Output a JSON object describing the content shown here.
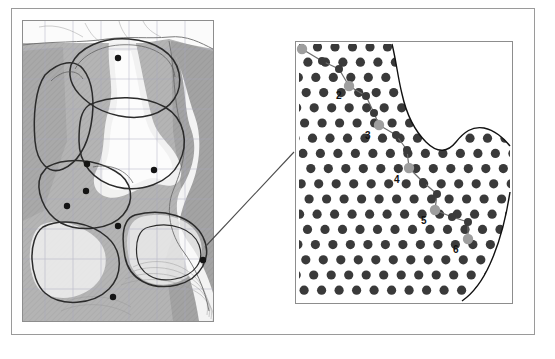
{
  "figure": {
    "title": "",
    "background_color": "#ffffff",
    "frame_color": "#9a9a9a",
    "width": 555,
    "height": 359
  },
  "left_panel": {
    "name": "regional-map",
    "description": "Grayscale shaded relief map with graticule grid, coastline contours and polygon region outlines",
    "border_color": "#8d8d8d",
    "land_fill": "#b4b4b4",
    "water_fill": "#f2f2f2",
    "mid_fill": "#c9c9c9",
    "dark_fill": "#9d9d9d",
    "grid_color": "#a9a9c0",
    "outline_color": "#2b2b2b",
    "contour_color": "#7a7a7a",
    "station_marker_color": "#141414",
    "station_markers": [
      {
        "id": "s1",
        "x": 95,
        "y": 37,
        "r": 3.2
      },
      {
        "id": "s2",
        "x": 64,
        "y": 143,
        "r": 3.2
      },
      {
        "id": "s3",
        "x": 63,
        "y": 170,
        "r": 3.2
      },
      {
        "id": "s4",
        "x": 131,
        "y": 149,
        "r": 3.2
      },
      {
        "id": "s5",
        "x": 44,
        "y": 185,
        "r": 3.2
      },
      {
        "id": "s6",
        "x": 95,
        "y": 205,
        "r": 3.2
      },
      {
        "id": "s7",
        "x": 90,
        "y": 276,
        "r": 3.2
      },
      {
        "id": "s8",
        "x": 180,
        "y": 239,
        "r": 3.2
      }
    ]
  },
  "right_panel": {
    "name": "sampling-lattice-detail",
    "description": "Zoomed detail showing hexagonal lattice of sampling nodes clipped by an irregular domain boundary, with a highlighted path of six numbered nodes",
    "border_color": "#8d8d8d",
    "dot_color": "#3a3a3a",
    "dot_radius": 4.6,
    "dot_spacing_x": 17.5,
    "dot_spacing_y": 15.2,
    "boundary_color": "#111111",
    "highlight_color": "#9e9e9e",
    "path_color": "#6b6b6b",
    "path_nodes": [
      {
        "label": "1",
        "x": 6,
        "y": 7,
        "label_dx": -12,
        "label_dy": -5,
        "highlight": true
      },
      {
        "label": "",
        "x": 26,
        "y": 19,
        "highlight": false
      },
      {
        "label": "",
        "x": 43,
        "y": 27,
        "highlight": false
      },
      {
        "label": "2",
        "x": 53,
        "y": 44,
        "label_dx": -13,
        "label_dy": 5,
        "highlight": true
      },
      {
        "label": "",
        "x": 70,
        "y": 54,
        "highlight": false
      },
      {
        "label": "",
        "x": 78,
        "y": 71,
        "highlight": false
      },
      {
        "label": "3",
        "x": 83,
        "y": 83,
        "label_dx": -14,
        "label_dy": 6,
        "highlight": true
      },
      {
        "label": "",
        "x": 100,
        "y": 93,
        "highlight": false
      },
      {
        "label": "",
        "x": 111,
        "y": 108,
        "highlight": false
      },
      {
        "label": "4",
        "x": 113,
        "y": 126,
        "label_dx": -15,
        "label_dy": 7,
        "highlight": true
      },
      {
        "label": "",
        "x": 127,
        "y": 140,
        "highlight": false
      },
      {
        "label": "",
        "x": 141,
        "y": 152,
        "highlight": false
      },
      {
        "label": "5",
        "x": 139,
        "y": 168,
        "label_dx": -14,
        "label_dy": 6,
        "highlight": true
      },
      {
        "label": "",
        "x": 156,
        "y": 175,
        "highlight": false
      },
      {
        "label": "",
        "x": 172,
        "y": 180,
        "highlight": false
      },
      {
        "label": "6",
        "x": 172,
        "y": 197,
        "label_dx": -15,
        "label_dy": 6,
        "highlight": true
      }
    ],
    "node_labels": [
      "1",
      "2",
      "3",
      "4",
      "5",
      "6"
    ]
  },
  "leader": {
    "name": "zoom-leader-line",
    "color": "#4a4a4a",
    "from": {
      "x": 205,
      "y": 247
    },
    "to": {
      "x": 294,
      "y": 152
    }
  }
}
